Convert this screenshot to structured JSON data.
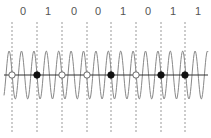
{
  "diagram": {
    "bits": [
      "0",
      "1",
      "0",
      "0",
      "1",
      "0",
      "1",
      "1"
    ],
    "bit_positions_x": [
      23,
      48,
      74,
      98,
      123,
      148,
      173,
      198
    ],
    "boundaries_x": [
      12,
      37,
      62,
      87,
      111,
      136,
      161,
      185
    ],
    "axis_y": 75,
    "wave_amplitude": 24,
    "wave_period": 12.4,
    "colors": {
      "wave": "#888888",
      "axis": "#333333",
      "dash": "#999999",
      "marker_filled": "#111111",
      "marker_open_stroke": "#666666",
      "label": "#555555"
    },
    "markers": [
      {
        "x": 12,
        "filled": false
      },
      {
        "x": 37,
        "filled": true
      },
      {
        "x": 62,
        "filled": false
      },
      {
        "x": 87,
        "filled": false
      },
      {
        "x": 111,
        "filled": true
      },
      {
        "x": 136,
        "filled": false
      },
      {
        "x": 161,
        "filled": true
      },
      {
        "x": 185,
        "filled": true
      }
    ]
  }
}
